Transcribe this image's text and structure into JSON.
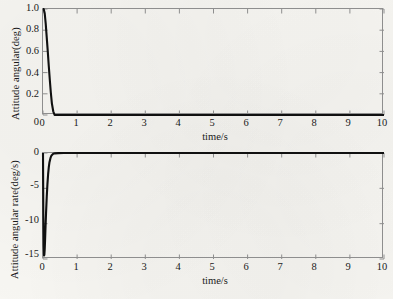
{
  "figure": {
    "background_color": "#f7f6f2",
    "trace_color": "#101010",
    "frame_color": "#8e8e8e"
  },
  "chart_data": [
    {
      "type": "line",
      "title": "",
      "xlabel": "time/s",
      "ylabel": "Attitude angular(deg)",
      "xlim": [
        0,
        10
      ],
      "ylim": [
        0,
        1.0
      ],
      "xticks": [
        "0",
        "1",
        "2",
        "3",
        "4",
        "5",
        "6",
        "7",
        "8",
        "9",
        "10"
      ],
      "yticks": [
        "0",
        "0.2",
        "0.4",
        "0.6",
        "0.8",
        "1.0"
      ],
      "grid": false,
      "legend": "none",
      "series": [
        {
          "name": "Attitude angular",
          "x": [
            0,
            0.02,
            0.05,
            0.08,
            0.11,
            0.14,
            0.17,
            0.2,
            0.23,
            0.26,
            0.3,
            0.34,
            0.38,
            0.45,
            0.55,
            0.7,
            0.9,
            1.2,
            1.6,
            2.0,
            2.5,
            3.0,
            3.5,
            4.0,
            4.5,
            5.0,
            5.5,
            6.0,
            6.5,
            7.0,
            7.5,
            8.0,
            8.5,
            9.0,
            9.5,
            10.0
          ],
          "y": [
            1.0,
            1.0,
            0.96,
            0.86,
            0.73,
            0.6,
            0.46,
            0.33,
            0.21,
            0.11,
            0.035,
            -0.012,
            -0.022,
            -0.016,
            -0.008,
            -0.003,
            -0.001,
            0.0,
            0.0,
            0.0,
            0.0,
            0.0,
            0.0,
            0.0,
            0.0,
            0.0,
            0.0,
            0.0,
            0.0,
            0.0,
            0.0,
            0.0,
            0.0,
            0.0,
            0.0,
            0.0
          ]
        }
      ]
    },
    {
      "type": "line",
      "title": "",
      "xlabel": "time/s",
      "ylabel": "Attitude angular rate(deg/s)",
      "xlim": [
        0,
        10
      ],
      "ylim": [
        -15,
        0
      ],
      "xticks": [
        "0",
        "1",
        "2",
        "3",
        "4",
        "5",
        "6",
        "7",
        "8",
        "9",
        "10"
      ],
      "yticks": [
        "0",
        "-5",
        "-10",
        "-15"
      ],
      "grid": false,
      "legend": "none",
      "series": [
        {
          "name": "Attitude angular rate",
          "x": [
            0,
            0.005,
            0.01,
            0.02,
            0.03,
            0.04,
            0.05,
            0.06,
            0.07,
            0.09,
            0.11,
            0.13,
            0.15,
            0.17,
            0.19,
            0.22,
            0.25,
            0.3,
            0.35,
            0.45,
            0.6,
            0.8,
            1.1,
            1.5,
            2.0,
            2.5,
            3.0,
            3.5,
            4.0,
            4.5,
            5.0,
            5.5,
            6.0,
            6.5,
            7.0,
            7.5,
            8.0,
            8.5,
            9.0,
            9.5,
            10.0
          ],
          "y": [
            0.0,
            -4.5,
            -9.0,
            -13.2,
            -14.5,
            -14.4,
            -13.6,
            -12.4,
            -11.0,
            -8.4,
            -6.2,
            -4.4,
            -3.0,
            -2.0,
            -1.3,
            -0.7,
            -0.35,
            -0.12,
            -0.05,
            -0.02,
            -0.008,
            -0.003,
            -0.001,
            0.0,
            0.0,
            0.0,
            0.0,
            0.0,
            0.0,
            0.0,
            0.0,
            0.0,
            0.0,
            0.0,
            0.0,
            0.0,
            0.0,
            0.0,
            0.0,
            0.0,
            0.0
          ]
        }
      ]
    }
  ]
}
